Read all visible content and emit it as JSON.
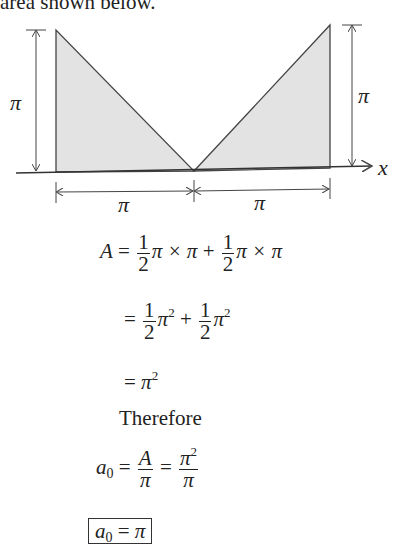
{
  "intro_text": "area shown below.",
  "figure": {
    "labels": {
      "left_height": "π",
      "right_height": "π",
      "left_width": "π",
      "right_width": "π",
      "axis": "x"
    },
    "fill_color": "#e3e3e3",
    "stroke_color": "#444444"
  },
  "derivation": {
    "line1": {
      "lhs": "A",
      "eq": "=",
      "frac1_num": "1",
      "frac1_den": "2",
      "term1": "π × π",
      "plus": "+",
      "frac2_num": "1",
      "frac2_den": "2",
      "term2": "π × π"
    },
    "line2": {
      "eq": "=",
      "frac1_num": "1",
      "frac1_den": "2",
      "term1": "π",
      "exp1": "2",
      "plus": "+",
      "frac2_num": "1",
      "frac2_den": "2",
      "term2": "π",
      "exp2": "2"
    },
    "line3": {
      "eq": "=",
      "term": "π",
      "exp": "2"
    },
    "therefore": "Therefore",
    "line4": {
      "lhs": "a",
      "sub": "0",
      "eq1": "=",
      "frac1_num": "A",
      "frac1_den": "π",
      "eq2": "=",
      "frac2_num": "π",
      "frac2_exp": "2",
      "frac2_den": "π"
    },
    "result": {
      "lhs": "a",
      "sub": "0",
      "eq": "=",
      "rhs": "π"
    }
  }
}
